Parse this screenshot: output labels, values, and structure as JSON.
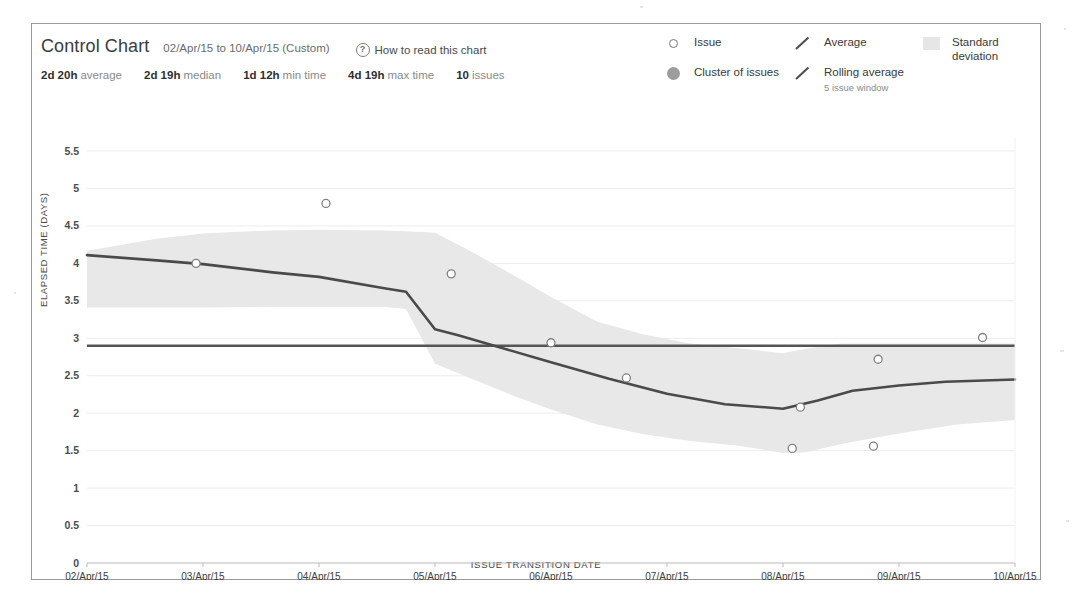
{
  "header": {
    "title": "Control Chart",
    "date_range": "02/Apr/15 to 10/Apr/15 (Custom)",
    "how_to_read": "How to read this chart",
    "help_icon": "question-circle-icon",
    "stats": [
      {
        "value": "2d 20h",
        "label": "average"
      },
      {
        "value": "2d 19h",
        "label": "median"
      },
      {
        "value": "1d 12h",
        "label": "min time"
      },
      {
        "value": "4d 19h",
        "label": "max time"
      },
      {
        "value": "10",
        "label": "issues"
      }
    ]
  },
  "legend": {
    "columns": [
      [
        {
          "icon": "open-circle-icon",
          "label": "Issue",
          "sub": ""
        },
        {
          "icon": "filled-circle-icon",
          "label": "Cluster of issues",
          "sub": ""
        }
      ],
      [
        {
          "icon": "slash-line-icon",
          "label": "Average",
          "sub": ""
        },
        {
          "icon": "slash-line-icon",
          "label": "Rolling average",
          "sub": "5 issue window"
        }
      ],
      [
        {
          "icon": "band-swatch-icon",
          "label": "Standard deviation",
          "sub": ""
        }
      ]
    ]
  },
  "colors": {
    "average_line": "#555555",
    "rolling_line": "#4a4a4a",
    "std_band": "#e8e8e8",
    "grid": "#ededed",
    "issue_marker_stroke": "#808080",
    "panel_border": "#9a9a9a",
    "text_primary": "#333333",
    "text_muted": "#8a8a8a"
  },
  "chart_data": {
    "type": "line",
    "title": "Control Chart",
    "xlabel": "ISSUE TRANSITION DATE",
    "ylabel": "ELAPSED TIME (DAYS)",
    "ylim": [
      0,
      5.5
    ],
    "yticks": [
      0,
      0.5,
      1,
      1.5,
      2,
      2.5,
      3,
      3.5,
      4,
      4.5,
      5,
      5.5
    ],
    "ytick_labels": [
      "0",
      "0.5",
      "1",
      "1.5",
      "2",
      "2.5",
      "3",
      "3.5",
      "4",
      "4.5",
      "5",
      "5.5"
    ],
    "categories": [
      "02/Apr/15",
      "03/Apr/15",
      "04/Apr/15",
      "05/Apr/15",
      "06/Apr/15",
      "07/Apr/15",
      "08/Apr/15",
      "09/Apr/15",
      "10/Apr/15"
    ],
    "xlim": [
      0,
      8
    ],
    "grid": true,
    "legend_position": "top-right",
    "average": 2.9,
    "series": [
      {
        "name": "Rolling average",
        "kind": "line",
        "x": [
          0.0,
          0.6,
          1.0,
          1.6,
          2.0,
          2.55,
          2.75,
          3.0,
          3.2,
          3.6,
          4.0,
          4.5,
          5.0,
          5.5,
          6.0,
          6.3,
          6.6,
          7.0,
          7.4,
          7.8,
          8.0
        ],
        "values": [
          4.11,
          4.04,
          3.99,
          3.88,
          3.82,
          3.67,
          3.62,
          3.12,
          3.04,
          2.86,
          2.68,
          2.46,
          2.26,
          2.12,
          2.06,
          2.17,
          2.3,
          2.37,
          2.42,
          2.44,
          2.45
        ]
      },
      {
        "name": "Average",
        "kind": "hline",
        "value": 2.9
      },
      {
        "name": "Standard deviation",
        "kind": "band",
        "x": [
          0.0,
          0.6,
          1.0,
          1.6,
          2.0,
          2.55,
          2.75,
          3.0,
          3.3,
          3.7,
          4.0,
          4.4,
          4.8,
          5.2,
          5.6,
          6.0,
          6.2,
          6.5,
          7.0,
          7.5,
          8.0
        ],
        "upper": [
          4.17,
          4.33,
          4.4,
          4.44,
          4.45,
          4.44,
          4.43,
          4.41,
          4.17,
          3.82,
          3.55,
          3.22,
          3.05,
          2.93,
          2.87,
          2.8,
          2.86,
          2.93,
          2.93,
          2.93,
          2.93
        ],
        "lower": [
          3.41,
          3.41,
          3.41,
          3.42,
          3.42,
          3.42,
          3.39,
          2.66,
          2.47,
          2.22,
          2.05,
          1.85,
          1.72,
          1.63,
          1.57,
          1.47,
          1.48,
          1.59,
          1.73,
          1.85,
          1.91
        ]
      },
      {
        "name": "Issue",
        "kind": "scatter",
        "points": [
          {
            "x": 0.94,
            "y": 4.0
          },
          {
            "x": 2.06,
            "y": 4.8
          },
          {
            "x": 3.14,
            "y": 3.86
          },
          {
            "x": 4.0,
            "y": 2.94
          },
          {
            "x": 4.65,
            "y": 2.47
          },
          {
            "x": 6.08,
            "y": 1.53
          },
          {
            "x": 6.15,
            "y": 2.08
          },
          {
            "x": 6.78,
            "y": 1.56
          },
          {
            "x": 6.82,
            "y": 2.72
          },
          {
            "x": 7.72,
            "y": 3.01
          }
        ]
      }
    ]
  }
}
